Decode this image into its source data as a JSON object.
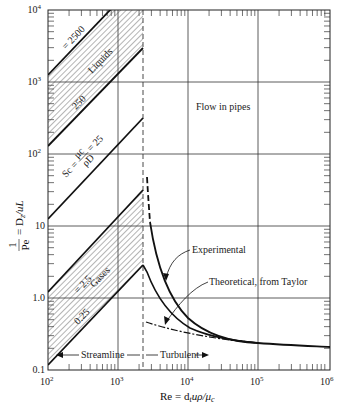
{
  "chart_data": {
    "type": "line",
    "title": "",
    "xlabel": "Re = d_t u ρ / μ_c",
    "ylabel": "1/Pe = D_z / uL",
    "xscale": "log",
    "yscale": "log",
    "xlim": [
      100,
      1000000
    ],
    "ylim": [
      0.1,
      10000
    ],
    "grid": true,
    "x_ticks": [
      "10²",
      "10³",
      "10⁴",
      "10⁵",
      "10⁶"
    ],
    "y_ticks": [
      "0.1",
      "1.0",
      "10",
      "10²",
      "10³",
      "10⁴"
    ],
    "transition_Re": 2300,
    "series": [
      {
        "name": "Sc = 2500 (Liquids upper)",
        "x": [
          100,
          800
        ],
        "y": [
          1300,
          10000
        ]
      },
      {
        "name": "Sc = 250 (Liquids lower)",
        "x": [
          100,
          2300
        ],
        "y": [
          130,
          2800
        ]
      },
      {
        "name": "Sc = 25",
        "x": [
          100,
          2300
        ],
        "y": [
          13,
          280
        ]
      },
      {
        "name": "Sc = 2.5 (Gases upper)",
        "x": [
          100,
          2300
        ],
        "y": [
          1.3,
          28
        ]
      },
      {
        "name": "Sc = 0.25 (Gases lower)",
        "x": [
          100,
          2300
        ],
        "y": [
          0.12,
          2.8
        ]
      },
      {
        "name": "Experimental",
        "x": [
          2500,
          3000,
          5000,
          10000,
          30000,
          100000,
          1000000
        ],
        "y": [
          45,
          10,
          2.5,
          0.9,
          0.35,
          0.24,
          0.2
        ]
      },
      {
        "name": "Theoretical, from Taylor",
        "x": [
          2300,
          3000,
          5000,
          10000,
          30000,
          100000,
          1000000
        ],
        "y": [
          2.8,
          1.6,
          0.75,
          0.45,
          0.28,
          0.23,
          0.2
        ]
      },
      {
        "name": "Theoretical extension (dash-dot)",
        "x": [
          2500,
          10000,
          30000,
          100000
        ],
        "y": [
          0.42,
          0.33,
          0.27,
          0.23
        ]
      }
    ],
    "annotations": [
      "= 2500",
      "Liquids",
      "250",
      "Sc = μc/ρD = 25",
      "= 2.5",
      "Gases",
      "0.25",
      "Flow in pipes",
      "Experimental",
      "Theoretical, from Taylor",
      "← Streamline",
      "Turbulent →"
    ],
    "shaded_regions": [
      {
        "name": "Liquids",
        "between": [
          "Sc = 2500",
          "Sc = 250"
        ]
      },
      {
        "name": "Gases",
        "between": [
          "Sc = 2.5",
          "Sc = 0.25"
        ]
      }
    ]
  },
  "labels": {
    "x_10_2": "10",
    "x_10_2_exp": "2",
    "x_10_3": "10",
    "x_10_3_exp": "3",
    "x_10_4": "10",
    "x_10_4_exp": "4",
    "x_10_5": "10",
    "x_10_5_exp": "5",
    "x_10_6": "10",
    "x_10_6_exp": "6",
    "y_0_1": "0.1",
    "y_1_0": "1.0",
    "y_10": "10",
    "y_10_2": "10",
    "y_10_2_exp": "2",
    "y_10_3": "10",
    "y_10_3_exp": "3",
    "y_10_4": "10",
    "y_10_4_exp": "4",
    "sc2500": "= 2500",
    "liquids": "Liquids",
    "sc250": "250",
    "sc25_prefix": "Sc =",
    "sc25_num": "μc",
    "sc25_den": "ρD",
    "sc25_suffix": "= 25",
    "sc2_5": "= 2.5",
    "gases": "Gases",
    "sc0_25": "0.25",
    "flow_in_pipes": "Flow in pipes",
    "experimental": "Experimental",
    "theoretical": "Theoretical, from Taylor",
    "streamline": "Streamline",
    "turbulent": "Turbulent",
    "xlabel": "Re = d",
    "xlabel_sub": "t",
    "xlabel_rest": "uρ/μ",
    "xlabel_sub2": "c",
    "ylabel_num": "1",
    "ylabel_den": "Pe",
    "ylabel_rest": "= D",
    "ylabel_sub": "z",
    "ylabel_tail": "/uL"
  }
}
